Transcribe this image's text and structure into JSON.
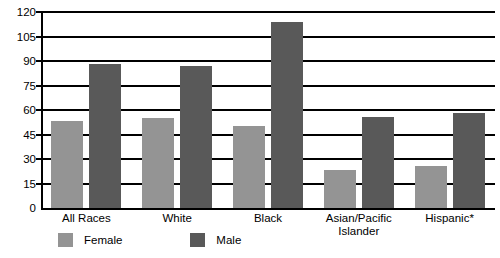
{
  "chart_data": {
    "type": "bar",
    "title": "",
    "subtitle": "",
    "xlabel": "",
    "ylabel": "",
    "ylim": [
      0,
      120
    ],
    "yticks": [
      0,
      15,
      30,
      45,
      60,
      75,
      90,
      105,
      120
    ],
    "grid": true,
    "legend_position": "bottom-left",
    "categories": [
      "All Races",
      "White",
      "Black",
      "Asian/Pacific\nIslander",
      "Hispanic*"
    ],
    "series": [
      {
        "name": "Female",
        "color": "#949494",
        "values": [
          53,
          55,
          50,
          23,
          26
        ]
      },
      {
        "name": "Male",
        "color": "#595959",
        "values": [
          88,
          87,
          114,
          56,
          58
        ]
      }
    ]
  },
  "colors": {
    "female": "#949494",
    "male": "#595959",
    "axis": "#000000",
    "background": "#ffffff"
  },
  "legend": {
    "items": [
      {
        "label": "Female",
        "swatch": "female"
      },
      {
        "label": "Male",
        "swatch": "male"
      }
    ]
  }
}
